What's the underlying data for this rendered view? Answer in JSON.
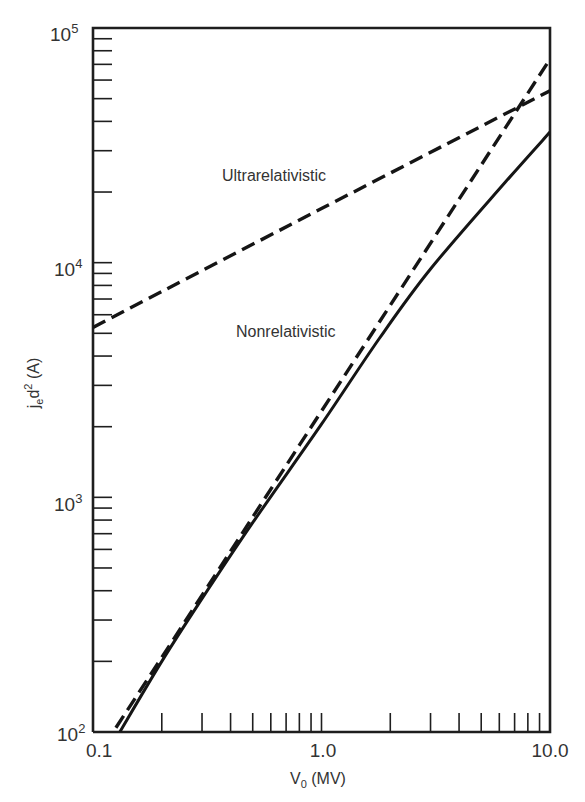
{
  "chart_data": {
    "type": "line",
    "title": "",
    "xlabel": "V0 (MV)",
    "ylabel": "jed2 (A)",
    "xscale": "log",
    "yscale": "log",
    "xlim": [
      0.1,
      10.0
    ],
    "ylim": [
      100,
      100000
    ],
    "grid": false,
    "legend": "none (inline annotations)",
    "x_tick_labels": [
      "0.1",
      "1.0",
      "10.0"
    ],
    "y_tick_labels": [
      {
        "base": "10",
        "exp": "2",
        "value": 100
      },
      {
        "base": "10",
        "exp": "3",
        "value": 1000
      },
      {
        "base": "10",
        "exp": "4",
        "value": 10000
      },
      {
        "base": "10",
        "exp": "5",
        "value": 100000
      }
    ],
    "series": [
      {
        "name": "Ultrarelativistic",
        "style": "dashed",
        "x": [
          0.1,
          1.0,
          10.0
        ],
        "values": [
          5300,
          17000,
          54000
        ]
      },
      {
        "name": "Nonrelativistic",
        "style": "dashed",
        "x": [
          0.1,
          0.2,
          0.5,
          1.0,
          2.0,
          5.0,
          10.0
        ],
        "values": [
          74,
          208,
          824,
          2330,
          6590,
          26050,
          73700
        ]
      },
      {
        "name": "Relativistic (exact)",
        "style": "solid",
        "x": [
          0.131,
          0.2,
          0.3,
          0.5,
          1.0,
          1.79,
          3.0,
          6.37,
          10.0
        ],
        "values": [
          100,
          200,
          370,
          780,
          2050,
          4750,
          9400,
          22000,
          36000
        ]
      }
    ],
    "annotations": [
      {
        "text": "Ultrarelativistic",
        "x": 0.38,
        "y": 33000
      },
      {
        "text": "Nonrelativistic",
        "x": 0.46,
        "y": 6900
      }
    ]
  },
  "labels": {
    "xlabel_main": "V",
    "xlabel_sub": "0",
    "xlabel_unit": " (MV)",
    "ylabel_main": "j",
    "ylabel_sub": "e",
    "ylabel_d": "d",
    "ylabel_sup": "2",
    "ylabel_unit": " (A)",
    "annot_ultra": "Ultrarelativistic",
    "annot_nonrel": "Nonrelativistic",
    "x_tick_0": "0.1",
    "x_tick_1": "1.0",
    "x_tick_2": "10.0",
    "y_base": "10",
    "y_exp_2": "2",
    "y_exp_3": "3",
    "y_exp_4": "4",
    "y_exp_5": "5"
  }
}
